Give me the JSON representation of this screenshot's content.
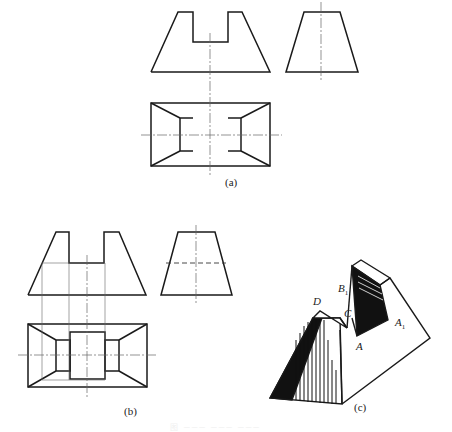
{
  "figure": {
    "subfigures": [
      {
        "id": "a",
        "label": "(a)",
        "description": "Three-view drawing: front view trapezoid with rectangular notch, side view trapezoid, top view rectangle with inclined face edges"
      },
      {
        "id": "b",
        "label": "(b)",
        "description": "Three-view drawing with projection construction lines and hidden line in side view; top view shows notch rectangle"
      },
      {
        "id": "c",
        "label": "(c)",
        "description": "Isometric sketch of notched truncated pyramid with shaded faces"
      }
    ],
    "point_labels": {
      "D": "D",
      "B1": "B",
      "B1_sub": "1",
      "C": "C",
      "A1": "A",
      "A1_sub": "1",
      "A": "A"
    },
    "caption": "图 ─── ─── ───",
    "colors": {
      "line": "#1a1a1a",
      "thin": "#555555",
      "shade": "#111111"
    }
  }
}
